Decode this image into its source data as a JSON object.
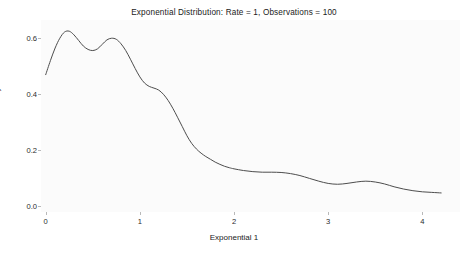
{
  "chart_data": {
    "type": "line",
    "title": "Exponential Distribution: Rate = 1, Observations = 100",
    "subtitle": "",
    "xlabel": "Exponential 1",
    "ylabel": "Density",
    "xlim": [
      -0.05,
      4.4
    ],
    "ylim": [
      -0.02,
      0.665
    ],
    "grid": false,
    "legend": null,
    "xticks": [
      0,
      1,
      2,
      3,
      4
    ],
    "xtick_labels": [
      "0",
      "1",
      "2",
      "3",
      "4"
    ],
    "yticks": [
      0.0,
      0.2,
      0.4,
      0.6
    ],
    "ytick_labels": [
      "0.0",
      "0.2",
      "0.4",
      "0.6"
    ],
    "line_color": "#4d4d4d",
    "line_width": 1,
    "panel_color": "#fbfbfb",
    "series": [
      {
        "name": "Density",
        "x": [
          0.0,
          0.05,
          0.1,
          0.15,
          0.2,
          0.25,
          0.3,
          0.35,
          0.4,
          0.45,
          0.5,
          0.55,
          0.6,
          0.65,
          0.7,
          0.75,
          0.8,
          0.85,
          0.9,
          0.95,
          1.0,
          1.05,
          1.1,
          1.15,
          1.2,
          1.25,
          1.3,
          1.35,
          1.4,
          1.45,
          1.5,
          1.55,
          1.6,
          1.65,
          1.7,
          1.75,
          1.8,
          1.85,
          1.9,
          1.95,
          2.0,
          2.1,
          2.2,
          2.3,
          2.4,
          2.5,
          2.6,
          2.7,
          2.8,
          2.9,
          3.0,
          3.1,
          3.2,
          3.3,
          3.4,
          3.5,
          3.6,
          3.7,
          3.8,
          3.9,
          4.0,
          4.1,
          4.2
        ],
        "y": [
          0.47,
          0.52,
          0.565,
          0.6,
          0.622,
          0.625,
          0.612,
          0.592,
          0.572,
          0.56,
          0.556,
          0.562,
          0.578,
          0.594,
          0.6,
          0.596,
          0.58,
          0.556,
          0.525,
          0.492,
          0.462,
          0.44,
          0.428,
          0.422,
          0.415,
          0.4,
          0.378,
          0.35,
          0.318,
          0.285,
          0.252,
          0.225,
          0.205,
          0.19,
          0.178,
          0.168,
          0.158,
          0.15,
          0.143,
          0.138,
          0.134,
          0.128,
          0.124,
          0.122,
          0.122,
          0.121,
          0.117,
          0.11,
          0.1,
          0.09,
          0.082,
          0.079,
          0.082,
          0.087,
          0.09,
          0.087,
          0.08,
          0.07,
          0.062,
          0.056,
          0.052,
          0.05,
          0.048
        ]
      }
    ]
  }
}
